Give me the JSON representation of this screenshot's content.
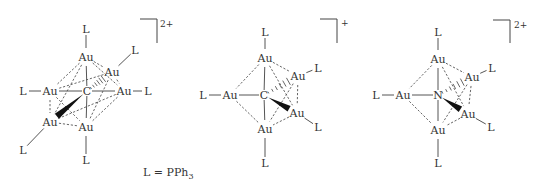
{
  "figure": {
    "legend": {
      "text": "L = PPh",
      "subscript": "3",
      "x": 143,
      "y": 176
    },
    "structures": [
      {
        "id": "au6c",
        "center": {
          "label": "C",
          "x": 87,
          "y": 91
        },
        "charge": {
          "text": "2+",
          "bracket": [
            140,
            19,
            157,
            43
          ],
          "x": 160,
          "y": 27
        },
        "atoms": [
          {
            "id": "au_top",
            "label": "Au",
            "x": 86,
            "y": 57
          },
          {
            "id": "au_ur",
            "label": "Au",
            "x": 112,
            "y": 72
          },
          {
            "id": "au_left",
            "label": "Au",
            "x": 50,
            "y": 91
          },
          {
            "id": "au_right",
            "label": "Au",
            "x": 124,
            "y": 91
          },
          {
            "id": "au_ll",
            "label": "Au",
            "x": 50,
            "y": 122
          },
          {
            "id": "au_bot",
            "label": "Au",
            "x": 86,
            "y": 127
          },
          {
            "id": "l_top",
            "label": "L",
            "x": 86,
            "y": 29
          },
          {
            "id": "l_ur",
            "label": "L",
            "x": 135,
            "y": 50
          },
          {
            "id": "l_left",
            "label": "L",
            "x": 23,
            "y": 91
          },
          {
            "id": "l_right",
            "label": "L",
            "x": 148,
            "y": 91
          },
          {
            "id": "l_ll",
            "label": "L",
            "x": 23,
            "y": 150
          },
          {
            "id": "l_bot",
            "label": "L",
            "x": 86,
            "y": 160
          }
        ],
        "solid": [
          [
            "l_top",
            "au_top"
          ],
          [
            "l_ur",
            "au_ur"
          ],
          [
            "l_left",
            "au_left"
          ],
          [
            "au_right",
            "l_right"
          ],
          [
            "au_ll",
            "l_ll"
          ],
          [
            "au_bot",
            "l_bot"
          ],
          [
            "au_top",
            "C"
          ],
          [
            "C",
            "au_bot"
          ],
          [
            "C",
            "au_right"
          ],
          [
            "au_left",
            "C"
          ]
        ],
        "dashed": [
          [
            "au_top",
            "au_ur"
          ],
          [
            "au_top",
            "au_left"
          ],
          [
            "au_top",
            "au_right"
          ],
          [
            "au_top",
            "au_ll"
          ],
          [
            "au_ur",
            "au_right"
          ],
          [
            "au_ur",
            "au_bot"
          ],
          [
            "au_ur",
            "au_left"
          ],
          [
            "au_left",
            "au_ll"
          ],
          [
            "au_left",
            "au_bot"
          ],
          [
            "au_right",
            "au_bot"
          ],
          [
            "au_right",
            "au_ll"
          ],
          [
            "au_ll",
            "au_bot"
          ]
        ],
        "hashed": [
          [
            "C",
            "au_ur"
          ]
        ],
        "wedge": [
          [
            "C",
            "au_ll"
          ]
        ]
      },
      {
        "id": "au5c",
        "center": {
          "label": "C",
          "x": 264,
          "y": 95
        },
        "charge": {
          "text": "+",
          "bracket": [
            320,
            19,
            337,
            43
          ],
          "x": 341,
          "y": 26
        },
        "atoms": [
          {
            "id": "au_top",
            "label": "Au",
            "x": 265,
            "y": 58
          },
          {
            "id": "au_ur",
            "label": "Au",
            "x": 298,
            "y": 76
          },
          {
            "id": "au_left",
            "label": "Au",
            "x": 230,
            "y": 95
          },
          {
            "id": "au_lr",
            "label": "Au",
            "x": 297,
            "y": 113
          },
          {
            "id": "au_bot",
            "label": "Au",
            "x": 265,
            "y": 129
          },
          {
            "id": "l_top",
            "label": "L",
            "x": 265,
            "y": 32
          },
          {
            "id": "l_ur",
            "label": "L",
            "x": 318,
            "y": 68
          },
          {
            "id": "l_left",
            "label": "L",
            "x": 203,
            "y": 95
          },
          {
            "id": "l_lr",
            "label": "L",
            "x": 318,
            "y": 127
          },
          {
            "id": "l_bot",
            "label": "L",
            "x": 265,
            "y": 163
          }
        ],
        "solid": [
          [
            "l_top",
            "au_top"
          ],
          [
            "au_ur",
            "l_ur"
          ],
          [
            "l_left",
            "au_left"
          ],
          [
            "au_lr",
            "l_lr"
          ],
          [
            "au_bot",
            "l_bot"
          ],
          [
            "au_top",
            "C"
          ],
          [
            "C",
            "au_bot"
          ],
          [
            "au_left",
            "C"
          ]
        ],
        "dashed": [
          [
            "au_top",
            "au_ur"
          ],
          [
            "au_top",
            "au_left"
          ],
          [
            "au_top",
            "au_lr"
          ],
          [
            "au_ur",
            "au_bot"
          ],
          [
            "au_ur",
            "au_lr"
          ],
          [
            "au_left",
            "au_bot"
          ],
          [
            "au_lr",
            "au_bot"
          ]
        ],
        "hashed": [
          [
            "C",
            "au_ur"
          ]
        ],
        "wedge": [
          [
            "C",
            "au_lr"
          ]
        ]
      },
      {
        "id": "au5n",
        "center": {
          "label": "N",
          "x": 438,
          "y": 95
        },
        "charge": {
          "text": "2+",
          "bracket": [
            493,
            20,
            510,
            43
          ],
          "x": 514,
          "y": 28
        },
        "atoms": [
          {
            "id": "au_top",
            "label": "Au",
            "x": 438,
            "y": 59
          },
          {
            "id": "au_ur",
            "label": "Au",
            "x": 472,
            "y": 77
          },
          {
            "id": "au_left",
            "label": "Au",
            "x": 403,
            "y": 95
          },
          {
            "id": "au_lr",
            "label": "Au",
            "x": 468,
            "y": 114
          },
          {
            "id": "au_bot",
            "label": "Au",
            "x": 438,
            "y": 130
          },
          {
            "id": "l_top",
            "label": "L",
            "x": 438,
            "y": 32
          },
          {
            "id": "l_ur",
            "label": "L",
            "x": 492,
            "y": 68
          },
          {
            "id": "l_left",
            "label": "L",
            "x": 376,
            "y": 95
          },
          {
            "id": "l_lr",
            "label": "L",
            "x": 491,
            "y": 127
          },
          {
            "id": "l_bot",
            "label": "L",
            "x": 438,
            "y": 163
          }
        ],
        "solid": [
          [
            "l_top",
            "au_top"
          ],
          [
            "au_ur",
            "l_ur"
          ],
          [
            "l_left",
            "au_left"
          ],
          [
            "au_lr",
            "l_lr"
          ],
          [
            "au_bot",
            "l_bot"
          ],
          [
            "au_top",
            "C"
          ],
          [
            "C",
            "au_bot"
          ],
          [
            "au_left",
            "C"
          ]
        ],
        "dashed": [
          [
            "au_top",
            "au_ur"
          ],
          [
            "au_top",
            "au_left"
          ],
          [
            "au_top",
            "au_lr"
          ],
          [
            "au_ur",
            "au_bot"
          ],
          [
            "au_ur",
            "au_lr"
          ],
          [
            "au_left",
            "au_bot"
          ],
          [
            "au_lr",
            "au_bot"
          ]
        ],
        "hashed": [
          [
            "C",
            "au_ur"
          ]
        ],
        "wedge": [
          [
            "C",
            "au_lr"
          ]
        ]
      }
    ]
  }
}
